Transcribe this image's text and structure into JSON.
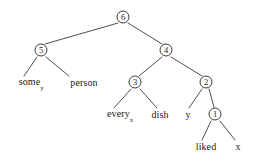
{
  "figure": {
    "kind": "syntactic-derivation-tree",
    "background_color": "#ffffff",
    "line_color": "#3a3a3a",
    "text_color": "#1a1a1a"
  },
  "nodes": {
    "n6": {
      "label": "6",
      "type": "circled",
      "x": 123,
      "y": 17
    },
    "n5": {
      "label": "5",
      "type": "circled",
      "x": 41,
      "y": 50
    },
    "n4": {
      "label": "4",
      "type": "circled",
      "x": 166,
      "y": 50
    },
    "n3": {
      "label": "3",
      "type": "circled",
      "x": 135,
      "y": 82
    },
    "n2": {
      "label": "2",
      "type": "circled",
      "x": 206,
      "y": 82
    },
    "n1": {
      "label": "1",
      "type": "circled",
      "x": 215,
      "y": 114
    },
    "some": {
      "label": "some",
      "sub": "y",
      "type": "leaf",
      "x": 31,
      "y": 83
    },
    "person": {
      "label": "person",
      "type": "leaf",
      "x": 84,
      "y": 83
    },
    "every": {
      "label": "every",
      "sub": "x",
      "type": "leaf",
      "x": 120,
      "y": 115
    },
    "dish": {
      "label": "dish",
      "type": "leaf",
      "x": 160,
      "y": 115
    },
    "yvar": {
      "label": "y",
      "type": "leaf",
      "x": 188,
      "y": 115
    },
    "liked": {
      "label": "liked",
      "type": "leaf",
      "x": 206,
      "y": 147
    },
    "xvar": {
      "label": "x",
      "type": "leaf",
      "x": 238,
      "y": 147
    }
  },
  "edges": [
    {
      "from": "n6",
      "to": "n5",
      "x1": 118,
      "y1": 23,
      "x2": 45,
      "y2": 44
    },
    {
      "from": "n6",
      "to": "n4",
      "x1": 128,
      "y1": 23,
      "x2": 162,
      "y2": 44
    },
    {
      "from": "n5",
      "to": "some",
      "x1": 37,
      "y1": 57,
      "x2": 24,
      "y2": 76
    },
    {
      "from": "n5",
      "to": "person",
      "x1": 46,
      "y1": 57,
      "x2": 69,
      "y2": 76
    },
    {
      "from": "n4",
      "to": "n3",
      "x1": 162,
      "y1": 57,
      "x2": 139,
      "y2": 76
    },
    {
      "from": "n4",
      "to": "n2",
      "x1": 171,
      "y1": 57,
      "x2": 202,
      "y2": 76
    },
    {
      "from": "n3",
      "to": "every",
      "x1": 131,
      "y1": 89,
      "x2": 114,
      "y2": 108
    },
    {
      "from": "n3",
      "to": "dish",
      "x1": 140,
      "y1": 89,
      "x2": 157,
      "y2": 108
    },
    {
      "from": "n2",
      "to": "yvar",
      "x1": 202,
      "y1": 89,
      "x2": 189,
      "y2": 108
    },
    {
      "from": "n2",
      "to": "n1",
      "x1": 209,
      "y1": 89,
      "x2": 214,
      "y2": 107
    },
    {
      "from": "n1",
      "to": "liked",
      "x1": 211,
      "y1": 121,
      "x2": 202,
      "y2": 140
    },
    {
      "from": "n1",
      "to": "xvar",
      "x1": 220,
      "y1": 121,
      "x2": 235,
      "y2": 140
    }
  ]
}
